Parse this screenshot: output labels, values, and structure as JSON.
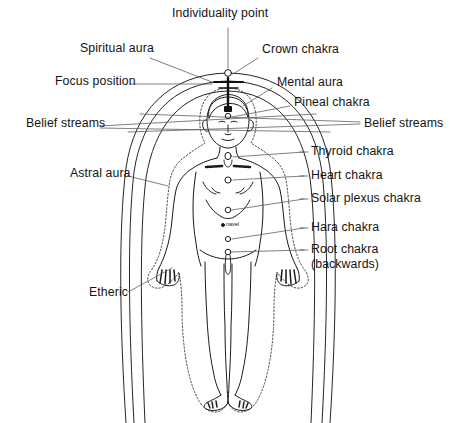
{
  "diagram": {
    "title": "Individuality point",
    "background_color": "#ffffff",
    "line_color": "#1a1a1a",
    "leader_color": "#555555",
    "labels": {
      "individuality_point": "Individuality point",
      "spiritual_aura": "Spiritual aura",
      "crown_chakra": "Crown chakra",
      "focus_position": "Focus position",
      "mental_aura": "Mental aura",
      "pineal_chakra": "Pineal chakra",
      "belief_streams_left": "Belief streams",
      "belief_streams_right": "Belief streams",
      "astral_aura": "Astral aura",
      "thyroid_chakra": "Thyroid chakra",
      "heart_chakra": "Heart chakra",
      "solar_plexus_chakra": "Solar plexus chakra",
      "hara_chakra": "Hara chakra",
      "root_chakra_line1": "Root chakra",
      "root_chakra_line2": "(backwards)",
      "etheric": "Etheric",
      "navel": "navel"
    }
  }
}
